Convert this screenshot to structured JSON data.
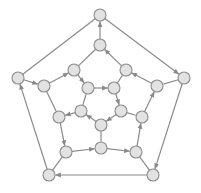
{
  "diagram": {
    "type": "directed-graph",
    "colors": {
      "node_fill": "#e2e2e2",
      "node_stroke": "#8c8c8c",
      "edge": "#8a8a8a",
      "background": "#ffffff"
    },
    "node_radius": 6,
    "nodes": [
      {
        "id": "O0",
        "x": 100,
        "y": 15
      },
      {
        "id": "O1",
        "x": 184,
        "y": 78
      },
      {
        "id": "O2",
        "x": 153,
        "y": 175
      },
      {
        "id": "O3",
        "x": 49,
        "y": 175
      },
      {
        "id": "O4",
        "x": 18,
        "y": 78
      },
      {
        "id": "M0",
        "x": 100,
        "y": 45
      },
      {
        "id": "M1",
        "x": 126,
        "y": 70
      },
      {
        "id": "M2",
        "x": 157,
        "y": 86
      },
      {
        "id": "M3",
        "x": 142,
        "y": 117
      },
      {
        "id": "M4",
        "x": 136,
        "y": 152
      },
      {
        "id": "M5",
        "x": 101,
        "y": 148
      },
      {
        "id": "M6",
        "x": 66,
        "y": 152
      },
      {
        "id": "M7",
        "x": 59,
        "y": 117
      },
      {
        "id": "M8",
        "x": 44,
        "y": 86
      },
      {
        "id": "M9",
        "x": 74,
        "y": 70
      },
      {
        "id": "I0",
        "x": 88,
        "y": 88
      },
      {
        "id": "I1",
        "x": 114,
        "y": 88
      },
      {
        "id": "I2",
        "x": 121,
        "y": 111
      },
      {
        "id": "I3",
        "x": 101,
        "y": 125
      },
      {
        "id": "I4",
        "x": 81,
        "y": 111
      }
    ],
    "edges": [
      {
        "from": "O0",
        "to": "O1",
        "directed": true
      },
      {
        "from": "O1",
        "to": "O2",
        "directed": true
      },
      {
        "from": "O2",
        "to": "O3",
        "directed": true
      },
      {
        "from": "O3",
        "to": "O4",
        "directed": true
      },
      {
        "from": "O4",
        "to": "M8",
        "directed": true
      },
      {
        "from": "M8",
        "to": "M9",
        "directed": true
      },
      {
        "from": "M9",
        "to": "I0",
        "directed": true
      },
      {
        "from": "I0",
        "to": "I1",
        "directed": true
      },
      {
        "from": "I1",
        "to": "I2",
        "directed": true
      },
      {
        "from": "I2",
        "to": "I3",
        "directed": true
      },
      {
        "from": "I3",
        "to": "I4",
        "directed": true
      },
      {
        "from": "I4",
        "to": "M7",
        "directed": true
      },
      {
        "from": "M7",
        "to": "M6",
        "directed": true
      },
      {
        "from": "M6",
        "to": "M5",
        "directed": true
      },
      {
        "from": "M5",
        "to": "M4",
        "directed": true
      },
      {
        "from": "M4",
        "to": "M3",
        "directed": true
      },
      {
        "from": "M3",
        "to": "M2",
        "directed": true
      },
      {
        "from": "M2",
        "to": "M1",
        "directed": true
      },
      {
        "from": "M1",
        "to": "M0",
        "directed": true
      },
      {
        "from": "M0",
        "to": "O0",
        "directed": true
      },
      {
        "from": "O4",
        "to": "O0",
        "directed": false
      },
      {
        "from": "M9",
        "to": "M0",
        "directed": false
      },
      {
        "from": "M8",
        "to": "M7",
        "directed": false
      },
      {
        "from": "O1",
        "to": "M2",
        "directed": false
      },
      {
        "from": "O2",
        "to": "M4",
        "directed": false
      },
      {
        "from": "O3",
        "to": "M6",
        "directed": false
      },
      {
        "from": "I1",
        "to": "M1",
        "directed": false
      },
      {
        "from": "I2",
        "to": "M3",
        "directed": false
      },
      {
        "from": "I3",
        "to": "M5",
        "directed": false
      },
      {
        "from": "I4",
        "to": "I0",
        "directed": false
      }
    ]
  }
}
